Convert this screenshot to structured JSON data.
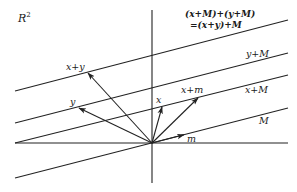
{
  "space": {
    "label": "R",
    "exponent": "2"
  },
  "colors": {
    "ink": "#222222",
    "background": "#ffffff"
  },
  "axes": {
    "horizontal": {
      "x1": 15,
      "y1": 143,
      "x2": 288,
      "y2": 143
    },
    "vertical": {
      "x1": 152,
      "y1": 10,
      "x2": 152,
      "y2": 183
    }
  },
  "lines": [
    {
      "id": "x-plus-y-plus-M",
      "label": "(x+M)+(y+M)",
      "label2": "=(x+y)+M",
      "x1": 15,
      "y1": 91,
      "x2": 288,
      "y2": 20
    },
    {
      "id": "y-plus-M",
      "label": "y+M",
      "x1": 15,
      "y1": 123,
      "x2": 288,
      "y2": 53
    },
    {
      "id": "x-plus-M",
      "label": "x+M",
      "x1": 15,
      "y1": 143,
      "x2": 288,
      "y2": 75
    },
    {
      "id": "M",
      "label": "M",
      "x1": 15,
      "y1": 178,
      "x2": 288,
      "y2": 108
    }
  ],
  "vectors": [
    {
      "id": "x-plus-y",
      "label": "x+y",
      "x2": 88,
      "y2": 73
    },
    {
      "id": "y",
      "label": "y",
      "x2": 79,
      "y2": 108
    },
    {
      "id": "x",
      "label": "x",
      "x2": 162,
      "y2": 107
    },
    {
      "id": "x-plus-m",
      "label": "x+m",
      "x2": 198,
      "y2": 98
    },
    {
      "id": "m",
      "label": "m",
      "x2": 184,
      "y2": 134
    }
  ],
  "origin": {
    "x": 152,
    "y": 143
  }
}
